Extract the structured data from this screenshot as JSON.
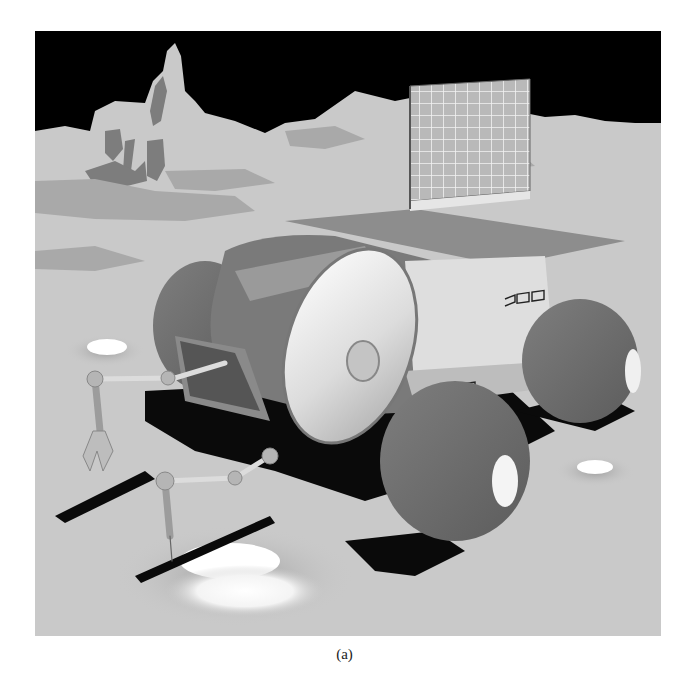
{
  "figure": {
    "elements": [
      "black sky",
      "lunar rock formations",
      "cylindrical rover body",
      "solar panel array",
      "four large balloon wheels",
      "two robotic manipulator arms",
      "craters",
      "shadows"
    ],
    "colors": {
      "sky": "#000000",
      "ground": "#c9c9c9",
      "ground_patch": "#a9a9a9",
      "rock_dark": "#7d7d7d",
      "wheel": "#6e6e6e",
      "body_dark": "#7a7a7a",
      "body_light": "#e8e8e8",
      "shadow": "#0a0a0a",
      "crater_highlight": "#ffffff"
    }
  },
  "caption": "(a)"
}
